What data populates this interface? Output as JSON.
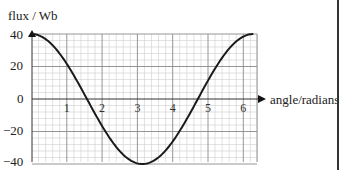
{
  "chart_data": {
    "type": "line",
    "title": "",
    "ylabel": "flux / Wb",
    "xlabel": "angle/radians",
    "xlim": [
      0,
      6.4
    ],
    "ylim": [
      -40,
      40
    ],
    "x_ticks": [
      "1",
      "2",
      "3",
      "4",
      "5",
      "6"
    ],
    "y_ticks": [
      "40",
      "20",
      "0",
      "−20",
      "−40"
    ],
    "grid": true,
    "series": [
      {
        "name": "flux",
        "function": "40*cos(angle)",
        "x": [
          0,
          0.5,
          1,
          1.5708,
          2,
          2.5,
          3,
          3.1416,
          3.5,
          4,
          4.5,
          4.7124,
          5,
          5.5,
          6,
          6.2832
        ],
        "y": [
          40,
          35.1,
          21.6,
          0,
          -16.6,
          -32,
          -39.6,
          -40,
          -37.5,
          -26.1,
          -8.4,
          0,
          11.3,
          28.4,
          38.4,
          40
        ]
      }
    ]
  },
  "labels": {
    "ylabel": "flux / Wb",
    "xlabel": "angle/radians",
    "y40": "40",
    "y20": "20",
    "y0": "0",
    "yn20": "−20",
    "yn40": "−40"
  }
}
